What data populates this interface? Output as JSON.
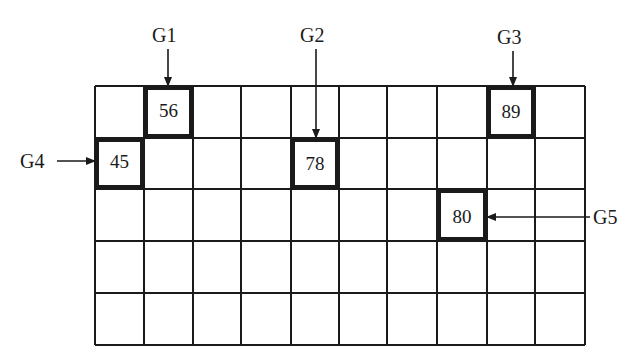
{
  "diagram": {
    "type": "grid-with-pointers",
    "grid": {
      "rows": 5,
      "cols": 10,
      "x_lines": [
        95,
        144,
        193,
        241,
        291,
        339,
        387,
        437,
        487,
        535,
        585
      ],
      "y_lines": [
        86,
        138,
        189,
        241,
        293,
        345
      ],
      "line_color": "#1a1a1a"
    },
    "highlighted_cells": [
      {
        "row": 0,
        "col": 1,
        "value": "56",
        "pointer": "G1",
        "pointer_dir": "down"
      },
      {
        "row": 0,
        "col": 8,
        "value": "89",
        "pointer": "G3",
        "pointer_dir": "down"
      },
      {
        "row": 1,
        "col": 0,
        "value": "45",
        "pointer": "G4",
        "pointer_dir": "right"
      },
      {
        "row": 1,
        "col": 4,
        "value": "78",
        "pointer": "G2",
        "pointer_dir": "down"
      },
      {
        "row": 2,
        "col": 7,
        "value": "80",
        "pointer": "G5",
        "pointer_dir": "left"
      }
    ],
    "labels": {
      "g1": "G1",
      "g2": "G2",
      "g3": "G3",
      "g4": "G4",
      "g5": "G5"
    },
    "values": {
      "v56": "56",
      "v89": "89",
      "v45": "45",
      "v78": "78",
      "v80": "80"
    }
  }
}
